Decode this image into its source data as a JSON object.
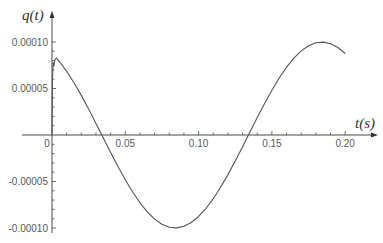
{
  "chart_data": {
    "type": "line",
    "title": "",
    "xlabel": "t(s)",
    "ylabel": "q(t)",
    "xlim": [
      0,
      0.2
    ],
    "ylim": [
      -0.0001,
      0.0001
    ],
    "grid": false,
    "legend": null,
    "x_ticks": [
      {
        "value": 0,
        "label": "0"
      },
      {
        "value": 0.05,
        "label": "0.05"
      },
      {
        "value": 0.1,
        "label": "0.10"
      },
      {
        "value": 0.15,
        "label": "0.15"
      },
      {
        "value": 0.2,
        "label": "0.20"
      }
    ],
    "x_minor_step": 0.01,
    "y_ticks": [
      {
        "value": 0.0001,
        "label": "0.00010"
      },
      {
        "value": 5e-05,
        "label": "0.00005"
      },
      {
        "value": -5e-05,
        "label": "-0.00005"
      },
      {
        "value": -0.0001,
        "label": "-0.00010"
      }
    ],
    "y_minor_step": 1e-05,
    "series": [
      {
        "name": "q(t)",
        "color": "#555555",
        "x": [
          0,
          0.0003,
          0.0008,
          0.0013,
          0.002,
          0.003,
          0.005,
          0.01,
          0.015,
          0.02,
          0.025,
          0.03,
          0.035,
          0.04,
          0.045,
          0.05,
          0.055,
          0.06,
          0.065,
          0.07,
          0.075,
          0.08,
          0.085,
          0.09,
          0.095,
          0.1,
          0.105,
          0.11,
          0.115,
          0.12,
          0.125,
          0.13,
          0.135,
          0.14,
          0.145,
          0.15,
          0.155,
          0.16,
          0.165,
          0.17,
          0.175,
          0.18,
          0.185,
          0.19,
          0.195,
          0.2
        ],
        "y": [
          0,
          6e-05,
          7.8e-05,
          7.4e-05,
          8.1e-05,
          8.27e-05,
          7.9e-05,
          6.85e-05,
          5.62e-05,
          4.26e-05,
          2.79e-05,
          1.25e-05,
          -3.1e-06,
          -1.87e-05,
          -3.39e-05,
          -4.82e-05,
          -6.13e-05,
          -7.29e-05,
          -8.27e-05,
          -9.05e-05,
          -9.6e-05,
          -9.92e-05,
          -9.99e-05,
          -9.82e-05,
          -9.41e-05,
          -8.76e-05,
          -7.9e-05,
          -6.85e-05,
          -5.62e-05,
          -4.26e-05,
          -2.79e-05,
          -1.25e-05,
          3.1e-06,
          1.87e-05,
          3.39e-05,
          4.82e-05,
          6.13e-05,
          7.29e-05,
          8.27e-05,
          9.05e-05,
          9.6e-05,
          9.92e-05,
          9.99e-05,
          9.82e-05,
          9.41e-05,
          8.76e-05
        ]
      }
    ]
  }
}
